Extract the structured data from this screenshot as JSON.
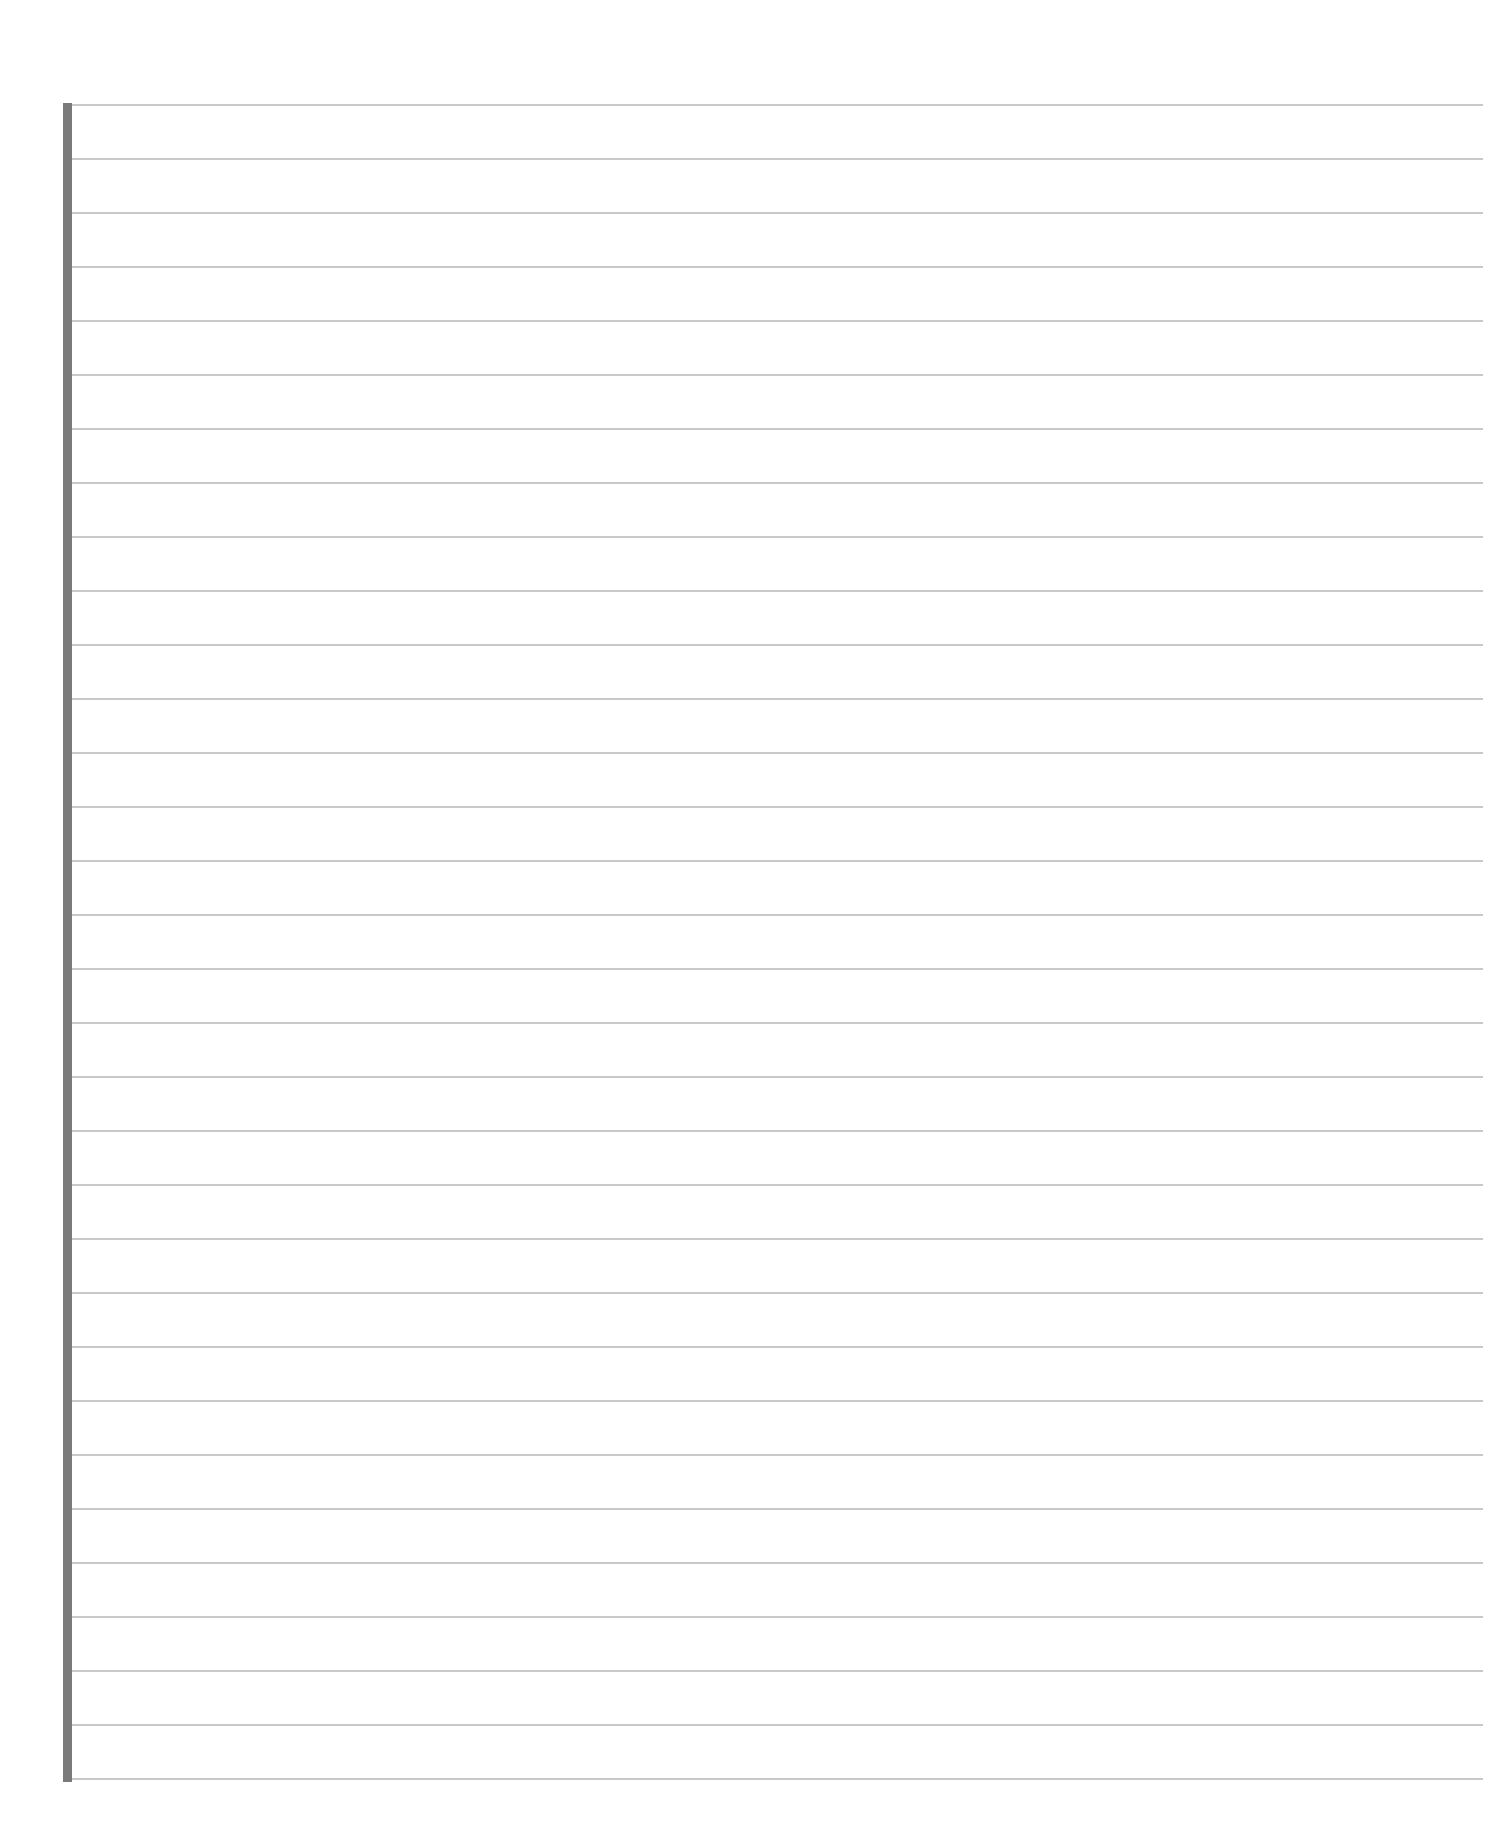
{
  "page": {
    "type": "lined-notebook-paper",
    "background_color": "#ffffff",
    "line_color": "#c9c9c9",
    "margin_bar_color": "#7a7a7a",
    "line_count": 32,
    "first_line_y": 104,
    "line_spacing_px": 54,
    "content_text": ""
  }
}
